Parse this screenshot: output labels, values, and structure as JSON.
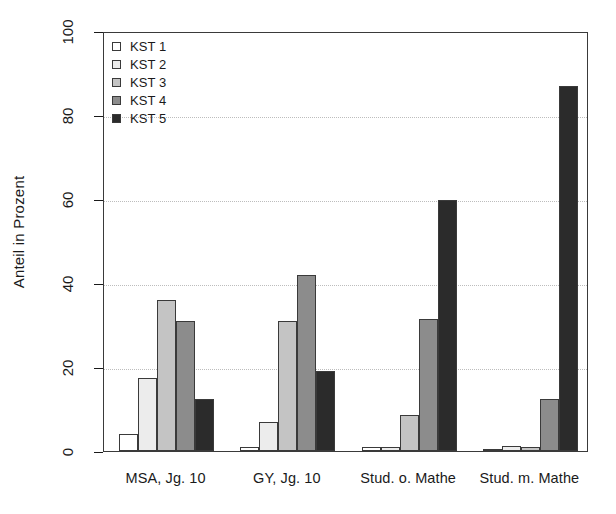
{
  "chart_data": {
    "type": "bar",
    "title": "",
    "subtitle": "",
    "xlabel": "",
    "ylabel": "Anteil in Prozent",
    "categories": [
      "MSA, Jg. 10",
      "GY, Jg. 10",
      "Stud. o. Mathe",
      "Stud. m. Mathe"
    ],
    "series": [
      {
        "name": "KST 1",
        "color": "#ffffff",
        "values": [
          4.0,
          1.0,
          1.0,
          0.3
        ]
      },
      {
        "name": "KST 2",
        "color": "#ececec",
        "values": [
          17.5,
          7.0,
          1.0,
          1.2
        ]
      },
      {
        "name": "KST 3",
        "color": "#c4c4c4",
        "values": [
          36.0,
          31.0,
          8.5,
          1.0
        ]
      },
      {
        "name": "KST 4",
        "color": "#8c8c8c",
        "values": [
          31.0,
          42.0,
          31.5,
          12.5
        ]
      },
      {
        "name": "KST 5",
        "color": "#2b2b2b",
        "values": [
          12.5,
          19.0,
          59.8,
          87.0
        ]
      }
    ],
    "ylim": [
      0,
      100
    ],
    "yticks": [
      0,
      20,
      40,
      60,
      80,
      100
    ],
    "ytick_labels": [
      "0",
      "20",
      "40",
      "60",
      "80",
      "100"
    ],
    "grid": "horizontal-dotted",
    "legend_position": "top-left-inside",
    "legend_entries": [
      "KST 1",
      "KST 2",
      "KST 3",
      "KST 4",
      "KST 5"
    ],
    "bar_border_color": "#3a3a3a",
    "axis_color": "#3a3a3a",
    "background_color": "#ffffff"
  }
}
